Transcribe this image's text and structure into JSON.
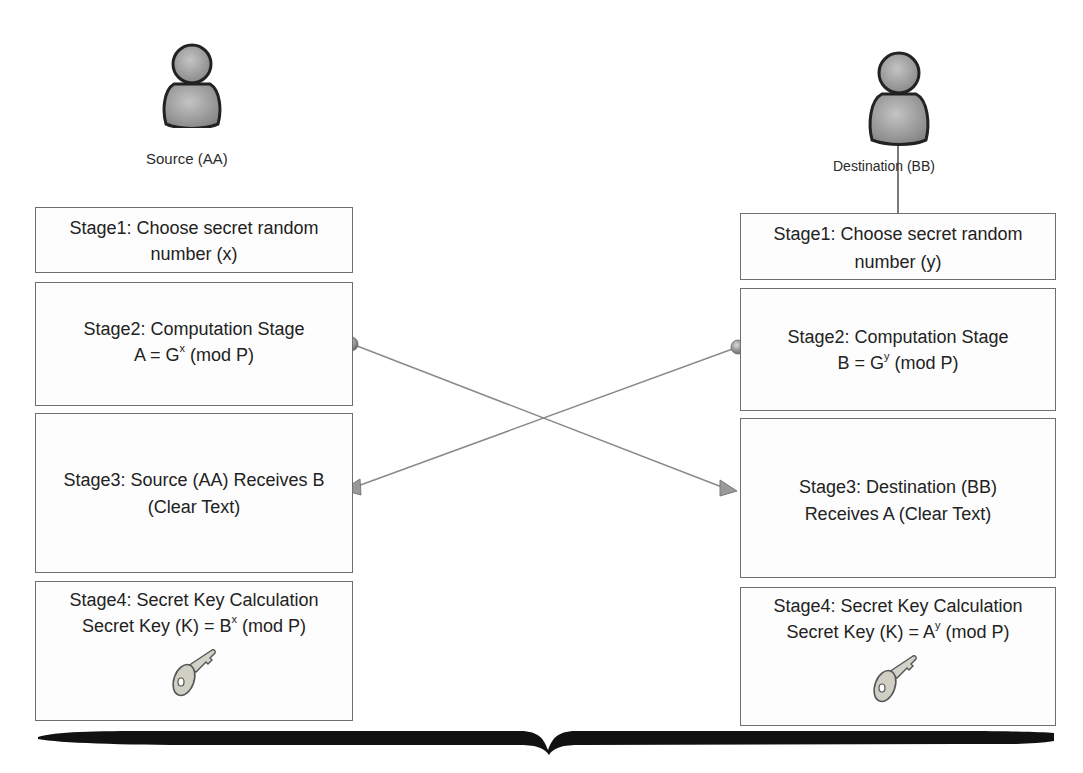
{
  "actors": {
    "source": {
      "label": "Source (AA)",
      "icon": "person-icon"
    },
    "destination": {
      "label": "Destination (BB)",
      "icon": "person-icon"
    }
  },
  "source_stages": [
    {
      "line1": "Stage1: Choose secret random",
      "line2": "number (x)"
    },
    {
      "line1": "Stage2: Computation Stage",
      "formula_prefix": "A = G",
      "formula_exp": "x",
      "formula_suffix": " (mod P)"
    },
    {
      "line1": "Stage3: Source (AA) Receives B",
      "line2": "(Clear Text)"
    },
    {
      "line1": "Stage4: Secret Key Calculation",
      "formula_prefix": "Secret Key (K) = B",
      "formula_exp": "x",
      "formula_suffix": " (mod P)",
      "icon": "key-icon"
    }
  ],
  "destination_stages": [
    {
      "line1": "Stage1: Choose secret random",
      "line2": "number (y)"
    },
    {
      "line1": "Stage2: Computation Stage",
      "formula_prefix": "B = G",
      "formula_exp": "y",
      "formula_suffix": " (mod P)"
    },
    {
      "line1": "Stage3: Destination (BB)",
      "line2": "Receives A (Clear Text)"
    },
    {
      "line1": "Stage4: Secret Key Calculation",
      "formula_prefix": "Secret Key (K) = A",
      "formula_exp": "y",
      "formula_suffix": " (mod P)",
      "icon": "key-icon"
    }
  ],
  "connectors": [
    {
      "from": "source.stage2",
      "to": "destination.stage3",
      "carries": "A"
    },
    {
      "from": "destination.stage2",
      "to": "source.stage3",
      "carries": "B"
    }
  ],
  "colors": {
    "border": "#6e6e6e",
    "person_fill": "#9a9a9a",
    "connector": "#8a8a8a",
    "brace": "#111111"
  }
}
